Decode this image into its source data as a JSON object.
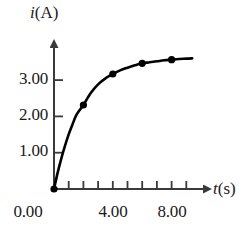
{
  "chart_data": {
    "type": "line",
    "title": "",
    "subtitle": "",
    "xlabel": "t(s)",
    "xlabel_symbol": "t",
    "xlabel_unit": "(s)",
    "ylabel": "i(A)",
    "ylabel_symbol": "i",
    "ylabel_unit": "(A)",
    "xlim": [
      0,
      10
    ],
    "ylim": [
      0,
      4.35
    ],
    "grid": false,
    "legend": null,
    "x_tick_values": [
      0,
      1,
      2,
      3,
      4,
      5,
      6,
      7,
      8,
      9,
      10
    ],
    "x_tick_labels": [
      "0.00",
      "",
      "",
      "",
      "4.00",
      "",
      "",
      "",
      "8.00",
      "",
      ""
    ],
    "x_labeled_ticks": [
      {
        "value": 0,
        "label": "0.00"
      },
      {
        "value": 4,
        "label": "4.00"
      },
      {
        "value": 8,
        "label": "8.00"
      }
    ],
    "y_tick_values": [
      1,
      2,
      3
    ],
    "y_tick_labels": [
      "1.00",
      "2.00",
      "3.00"
    ],
    "y_labeled_ticks": [
      {
        "value": 3,
        "label": "3.00"
      },
      {
        "value": 2,
        "label": "2.00"
      },
      {
        "value": 1,
        "label": "1.00"
      }
    ],
    "series": [
      {
        "name": "current",
        "marker": "filled-circle",
        "color": "#000000",
        "line_width": 2.6,
        "points": [
          {
            "x": 0,
            "y": 0.0
          },
          {
            "x": 2,
            "y": 2.52
          },
          {
            "x": 4,
            "y": 3.45
          },
          {
            "x": 6,
            "y": 3.77
          },
          {
            "x": 8,
            "y": 3.88
          }
        ],
        "curve_values": [
          {
            "x": 0.0,
            "y": 0.0
          },
          {
            "x": 0.25,
            "y": 0.49
          },
          {
            "x": 0.5,
            "y": 0.92
          },
          {
            "x": 0.75,
            "y": 1.3
          },
          {
            "x": 1.0,
            "y": 1.64
          },
          {
            "x": 1.25,
            "y": 1.93
          },
          {
            "x": 1.5,
            "y": 2.2
          },
          {
            "x": 1.75,
            "y": 2.37
          },
          {
            "x": 2.0,
            "y": 2.52
          },
          {
            "x": 2.5,
            "y": 2.88
          },
          {
            "x": 3.0,
            "y": 3.14
          },
          {
            "x": 3.5,
            "y": 3.32
          },
          {
            "x": 4.0,
            "y": 3.45
          },
          {
            "x": 4.5,
            "y": 3.56
          },
          {
            "x": 5.0,
            "y": 3.64
          },
          {
            "x": 5.5,
            "y": 3.71
          },
          {
            "x": 6.0,
            "y": 3.77
          },
          {
            "x": 6.5,
            "y": 3.8
          },
          {
            "x": 7.0,
            "y": 3.83
          },
          {
            "x": 7.5,
            "y": 3.86
          },
          {
            "x": 8.0,
            "y": 3.88
          },
          {
            "x": 8.5,
            "y": 3.9
          },
          {
            "x": 9.0,
            "y": 3.91
          },
          {
            "x": 9.4,
            "y": 3.92
          }
        ],
        "asymptote": 3.95
      }
    ],
    "annotations": []
  },
  "axes": {
    "y_axis_title": "i(A)",
    "x_axis_title": "t(s)",
    "y_symbol": "i",
    "y_unit": "(A)",
    "x_symbol": "t",
    "x_unit": "(s)",
    "arrowheads": true,
    "origin_marker": "filled-circle"
  },
  "style": {
    "background": "#ffffff",
    "ink": "#000000",
    "axis_color": "#3a3a3a",
    "text_color": "#1a1a1a"
  }
}
